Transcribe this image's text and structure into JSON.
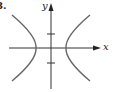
{
  "figure": {
    "problem_label": "8.",
    "x_axis_label": "x",
    "y_axis_label": "y",
    "curve": "hyperbola (horizontal transverse axis)",
    "colors": {
      "axes": "#333333",
      "curve": "#666666"
    }
  }
}
